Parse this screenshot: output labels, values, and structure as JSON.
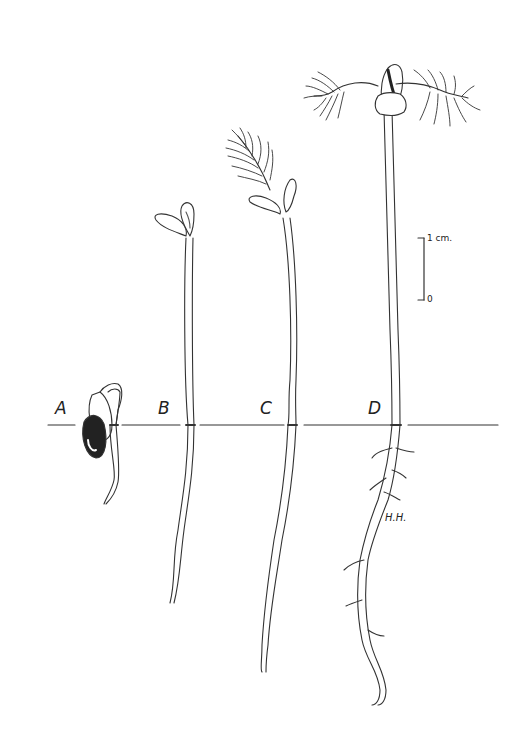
{
  "figure": {
    "type": "botanical line drawing",
    "stages": [
      {
        "label": "A",
        "description": "germinating seed with emerging radicle"
      },
      {
        "label": "B",
        "description": "seedling with cotyledons opening"
      },
      {
        "label": "C",
        "description": "seedling with first pinnate leaf emerging"
      },
      {
        "label": "D",
        "description": "seedling with two pinnate leaves and branched root"
      }
    ],
    "scale_bar": {
      "top_label": "1 cm.",
      "bottom_label": "0"
    },
    "artist_initials": "H.H.",
    "ground_line": true
  }
}
